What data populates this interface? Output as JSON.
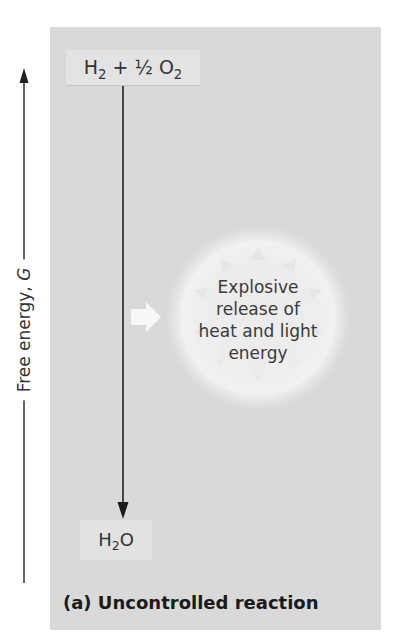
{
  "diagram": {
    "axis": {
      "label": "Free energy,",
      "variable": "G",
      "direction": "up"
    },
    "reactants": {
      "h": "H",
      "h_sub": "2",
      "plus": " + ",
      "half": "½",
      "o": " O",
      "o_sub": "2"
    },
    "product": {
      "h": "H",
      "h_sub": "2",
      "o": "O"
    },
    "energy_release": {
      "lines": [
        "Explosive",
        "release of",
        "heat and light",
        "energy"
      ]
    },
    "caption": "(a) Uncontrolled reaction",
    "colors": {
      "panel": "#d9d9d9",
      "label_box": "#e3e3e3",
      "arrow": "#222222",
      "text": "#333333",
      "burst": "#f4f4f4"
    }
  }
}
